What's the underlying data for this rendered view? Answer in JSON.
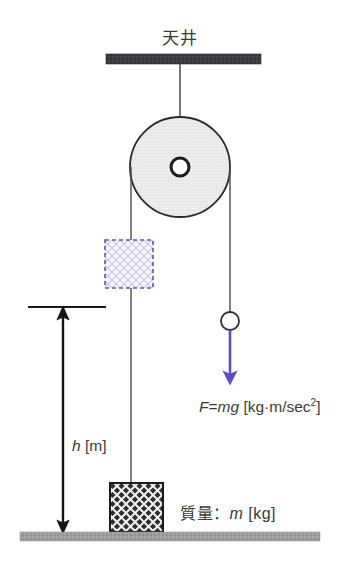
{
  "figure": {
    "title_text": "天井"
  },
  "labels": {
    "ceiling": "天井",
    "force_prefix": "F",
    "force_equals": "=",
    "force_mg": "mg",
    "force_units_open": " [kg·m/sec",
    "force_units_exp": "2",
    "force_units_close": "]",
    "force_full": "F=mg [kg·m/sec2]",
    "height_symbol": "h",
    "height_units": " [m]",
    "height_full": "h [m]",
    "mass_prefix": "質量：",
    "mass_symbol": "m",
    "mass_units": " [kg]",
    "mass_full": "質量：m [kg]"
  },
  "colors": {
    "ceiling_bar": "#3b3b40",
    "ground_bar": "#9a9a9a",
    "rope": "#4a4a4a",
    "pulley_stroke": "#2b2b2b",
    "pulley_fill": "#ededed",
    "force_arrow": "#5b4fc4",
    "dashed_box_stroke": "#5a52b8",
    "dashed_box_fill": "#f4f4f8",
    "block_fill": "#2e2e2e",
    "block_hatch": "#ffffff",
    "dim_arrow": "#1a1a1a",
    "text": "#3a3a3a",
    "background": "#ffffff"
  },
  "geometry": {
    "ceiling_bar": {
      "x": 106,
      "y": 54,
      "width": 155,
      "height": 10
    },
    "ground_bar": {
      "x": 20,
      "y": 532,
      "width": 300,
      "height": 9
    },
    "pulley": {
      "cx": 180,
      "cy": 167,
      "r": 50,
      "hub_r": 9,
      "hub_inner_r": 4.5
    },
    "support_rope": {
      "x": 180,
      "y1": 64,
      "y2": 167
    },
    "left_rope": {
      "x": 131,
      "y1": 167,
      "y2": 483
    },
    "right_rope": {
      "x": 230,
      "y1": 167,
      "y2": 313
    },
    "hanging_ball": {
      "cx": 230,
      "cy": 321,
      "r": 9
    },
    "force_arrow": {
      "x": 230,
      "y1": 330,
      "y2": 383
    },
    "dashed_box": {
      "x": 105,
      "y": 240,
      "width": 48,
      "height": 48
    },
    "block": {
      "x": 110,
      "y": 483,
      "width": 53,
      "height": 49
    },
    "dim_arrow": {
      "x": 63,
      "y_top": 307,
      "y_bottom": 533
    },
    "dim_tick": {
      "x1": 28,
      "x2": 106,
      "y": 307
    }
  },
  "annotations": {
    "ceiling_label_anchor": "top-center",
    "force_label_anchor": "right-of-arrow",
    "height_label_anchor": "right-of-dim-arrow",
    "mass_label_anchor": "right-of-block"
  }
}
